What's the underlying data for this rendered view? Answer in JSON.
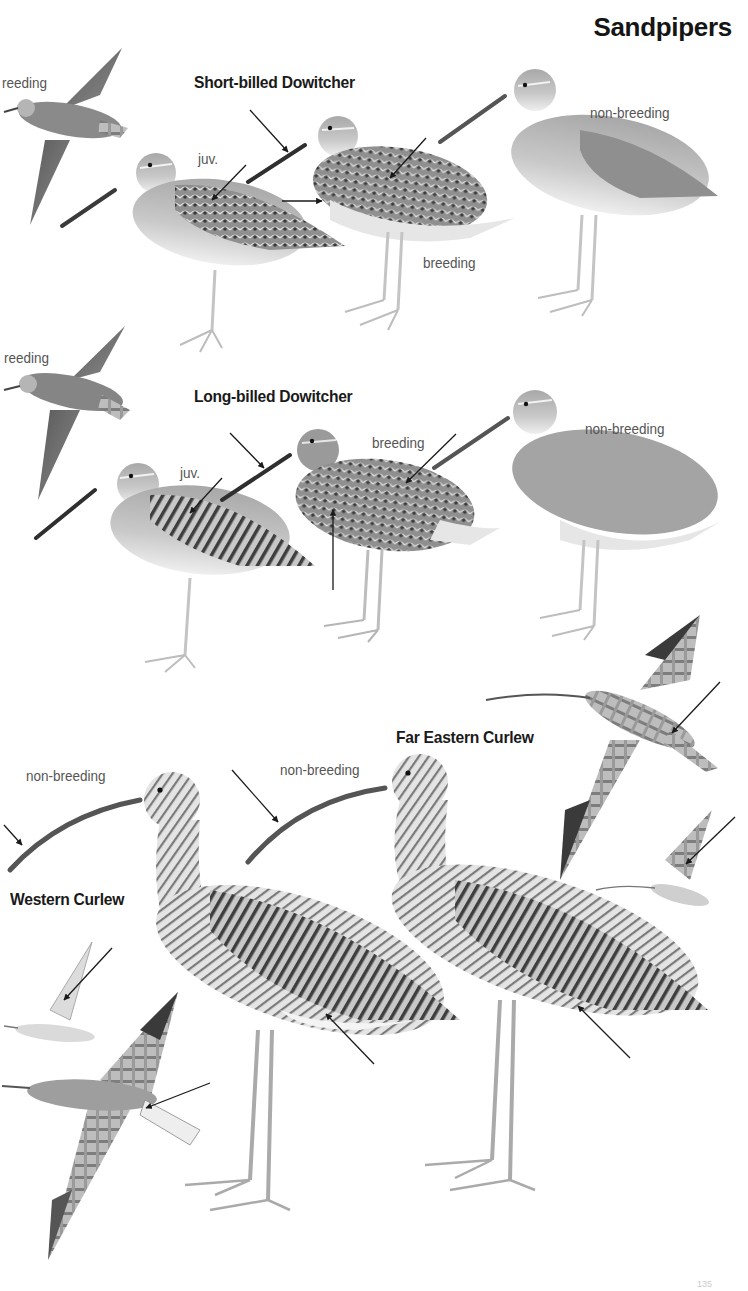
{
  "page": {
    "title": "Sandpipers",
    "page_number_partial": "135"
  },
  "sections": [
    {
      "species": "Short-billed Dowitcher",
      "flight_label": "reeding",
      "figures": [
        {
          "label": "juv."
        },
        {
          "label": "breeding"
        },
        {
          "label": "non-breeding"
        }
      ]
    },
    {
      "species": "Long-billed Dowitcher",
      "flight_label": "reeding",
      "figures": [
        {
          "label": "juv."
        },
        {
          "label": "breeding"
        },
        {
          "label": "non-breeding"
        }
      ]
    },
    {
      "species": "Western Curlew",
      "figures": [
        {
          "label": "non-breeding"
        }
      ]
    },
    {
      "species": "Far Eastern Curlew",
      "figures": [
        {
          "label": "non-breeding"
        }
      ]
    }
  ],
  "colors": {
    "ink": "#1a1a1a",
    "label_gray": "#555555",
    "bird_light": "#d9d9d9",
    "bird_mid": "#9a9a9a",
    "bird_dark": "#4a4a4a",
    "background": "#ffffff"
  }
}
